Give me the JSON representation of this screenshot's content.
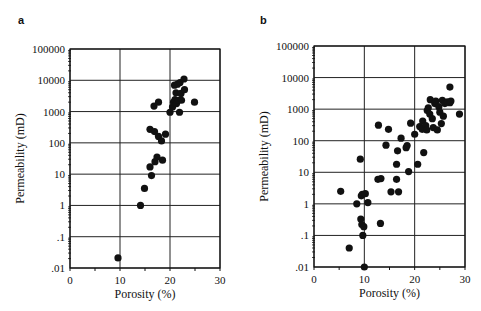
{
  "figure": {
    "panels": [
      {
        "label": "a",
        "xlabel": "Porosity (%)",
        "ylabel": "Permeability (mD)"
      },
      {
        "label": "b",
        "xlabel": "Porosity (%)",
        "ylabel": "Permeability (mD)"
      }
    ]
  },
  "chart_data": [
    {
      "type": "scatter",
      "title": "a",
      "xlabel": "Porosity (%)",
      "ylabel": "Permeability (mD)",
      "xlim": [
        0,
        30
      ],
      "ylim": [
        0.01,
        100000
      ],
      "yscale": "log",
      "xticks": [
        "0",
        "10",
        "20",
        "30"
      ],
      "yticks": [
        ".01",
        ".1",
        "1",
        "10",
        "100",
        "1000",
        "10000",
        "100000"
      ],
      "grid": true,
      "series": [
        {
          "name": "samples",
          "points": [
            [
              9.6,
              0.021
            ],
            [
              14.1,
              1.0
            ],
            [
              14.9,
              3.5
            ],
            [
              16.3,
              9
            ],
            [
              16.0,
              17
            ],
            [
              17.0,
              25
            ],
            [
              17.4,
              35
            ],
            [
              18.5,
              28
            ],
            [
              16.0,
              270
            ],
            [
              16.9,
              230
            ],
            [
              17.7,
              160
            ],
            [
              18.3,
              115
            ],
            [
              19.1,
              190
            ],
            [
              16.8,
              1500
            ],
            [
              17.7,
              2000
            ],
            [
              20.0,
              950
            ],
            [
              21.9,
              950
            ],
            [
              24.9,
              2000
            ],
            [
              20.5,
              1400
            ],
            [
              20.7,
              2000
            ],
            [
              21.0,
              2400
            ],
            [
              21.3,
              1800
            ],
            [
              21.7,
              2300
            ],
            [
              22.3,
              2300
            ],
            [
              21.2,
              4000
            ],
            [
              22.2,
              3800
            ],
            [
              22.9,
              5000
            ],
            [
              20.9,
              7000
            ],
            [
              21.5,
              7500
            ],
            [
              22.0,
              8500
            ],
            [
              22.8,
              11000
            ]
          ]
        }
      ]
    },
    {
      "type": "scatter",
      "title": "b",
      "xlabel": "Porosity (%)",
      "ylabel": "Permeability (mD)",
      "xlim": [
        0,
        30
      ],
      "ylim": [
        0.01,
        100000
      ],
      "yscale": "log",
      "xticks": [
        "0",
        "10",
        "20",
        "30"
      ],
      "yticks": [
        ".01",
        ".1",
        "1",
        "10",
        "100",
        "1000",
        "10000",
        "100000"
      ],
      "grid": true,
      "series": [
        {
          "name": "samples",
          "points": [
            [
              5.3,
              2.5
            ],
            [
              7.0,
              0.04
            ],
            [
              8.5,
              1.0
            ],
            [
              9.2,
              26
            ],
            [
              9.3,
              0.33
            ],
            [
              9.5,
              0.22
            ],
            [
              9.7,
              0.1
            ],
            [
              9.9,
              0.19
            ],
            [
              9.4,
              1.8
            ],
            [
              9.6,
              2.0
            ],
            [
              10.2,
              2.1
            ],
            [
              10.7,
              1.1
            ],
            [
              10.0,
              0.01
            ],
            [
              12.7,
              6
            ],
            [
              13.3,
              6.3
            ],
            [
              13.2,
              0.24
            ],
            [
              12.8,
              310
            ],
            [
              14.3,
              72
            ],
            [
              14.8,
              230
            ],
            [
              15.3,
              2.4
            ],
            [
              16.4,
              18
            ],
            [
              16.4,
              6
            ],
            [
              16.6,
              48
            ],
            [
              16.8,
              2.4
            ],
            [
              17.3,
              120
            ],
            [
              18.3,
              60
            ],
            [
              18.5,
              70
            ],
            [
              18.8,
              10.5
            ],
            [
              19.2,
              360
            ],
            [
              20.0,
              160
            ],
            [
              20.6,
              18
            ],
            [
              21.0,
              280
            ],
            [
              21.5,
              230
            ],
            [
              21.6,
              420
            ],
            [
              21.8,
              42
            ],
            [
              22.2,
              300
            ],
            [
              22.4,
              220
            ],
            [
              22.5,
              900
            ],
            [
              22.7,
              1100
            ],
            [
              23.0,
              700
            ],
            [
              23.1,
              2000
            ],
            [
              23.5,
              500
            ],
            [
              23.7,
              260
            ],
            [
              24.0,
              1500
            ],
            [
              24.2,
              1800
            ],
            [
              24.5,
              220
            ],
            [
              24.8,
              1200
            ],
            [
              25.0,
              800
            ],
            [
              25.3,
              350
            ],
            [
              25.5,
              1900
            ],
            [
              25.7,
              600
            ],
            [
              26.0,
              1500
            ],
            [
              26.5,
              1700
            ],
            [
              27.0,
              1600
            ],
            [
              27.2,
              1800
            ],
            [
              27.0,
              5000
            ],
            [
              28.9,
              700
            ]
          ]
        }
      ]
    }
  ]
}
